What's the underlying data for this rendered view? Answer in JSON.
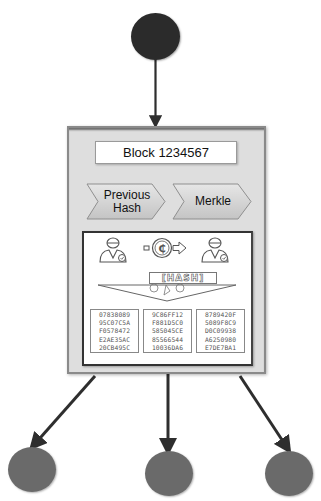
{
  "diagram": {
    "type": "blockchain-block-diagram",
    "block": {
      "title": "Block 1234567",
      "fields": [
        {
          "label_line1": "Previous",
          "label_line2": "Hash"
        },
        {
          "label_line1": "Merkle",
          "label_line2": ""
        }
      ],
      "illustration": {
        "hash_label": "[HASH]",
        "icons": [
          "user-left-icon",
          "coin-icon",
          "arrow-right-icon",
          "user-right-icon",
          "gears-icon"
        ],
        "hash_columns": [
          [
            "07838089",
            "95C07C5A",
            "F0578472",
            "E2AE35AC",
            "20CB495C"
          ],
          [
            "9C86FF12",
            "F881D5C0",
            "585045CE",
            "85566544",
            "10036DA6"
          ],
          [
            "8789420F",
            "5089F8C9",
            "D0C09938",
            "A6250980",
            "E7DE7BA1"
          ]
        ]
      }
    },
    "nodes": {
      "parent": {
        "color": "#2b2b2b"
      },
      "children": [
        {
          "color": "#6a6a6a"
        },
        {
          "color": "#6a6a6a"
        },
        {
          "color": "#6a6a6a"
        }
      ]
    },
    "colors": {
      "frame": "#dedede",
      "frame_border": "#8a8a8a",
      "arrow": "#2e2e2e",
      "chevron": "#d2d2d2"
    }
  }
}
